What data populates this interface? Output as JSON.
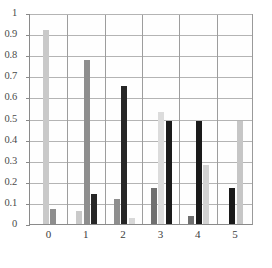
{
  "chart_data": {
    "type": "bar",
    "title": "",
    "subtitle": "",
    "xlabel": "",
    "ylabel": "",
    "categories": [
      "0",
      "1",
      "2",
      "3",
      "4",
      "5"
    ],
    "ylim": [
      0,
      1
    ],
    "yticks": [
      "0",
      "0.1",
      "0.2",
      "0.3",
      "0.4",
      "0.5",
      "0.6",
      "0.7",
      "0.8",
      "0.9",
      "1"
    ],
    "ytick_values": [
      0,
      0.1,
      0.2,
      0.3,
      0.4,
      0.5,
      0.6,
      0.7,
      0.8,
      0.9,
      1
    ],
    "grid": "horizontal-and-vertical",
    "legend": "none",
    "series": [
      {
        "name": "series-light",
        "color": "#c9c9c9",
        "values": [
          0.92,
          0.06,
          0.0,
          0.53,
          0.28,
          0.49
        ]
      },
      {
        "name": "series-medium",
        "color": "#8e8e8e",
        "values": [
          0.07,
          0.775,
          0.12,
          0.0,
          0.0,
          0.0
        ]
      },
      {
        "name": "series-dark",
        "color": "#262626",
        "values": [
          0.0,
          0.14,
          0.655,
          0.49,
          0.49,
          0.17
        ]
      }
    ],
    "group_bars": [
      {
        "category": "0",
        "bars": [
          {
            "series": "series-light",
            "value": 0.92,
            "color": "#c9c9c9"
          },
          {
            "series": "series-medium",
            "value": 0.07,
            "color": "#8e8e8e"
          }
        ]
      },
      {
        "category": "1",
        "bars": [
          {
            "series": "series-light",
            "value": 0.06,
            "color": "#c9c9c9"
          },
          {
            "series": "series-medium",
            "value": 0.775,
            "color": "#8e8e8e"
          },
          {
            "series": "series-dark",
            "value": 0.14,
            "color": "#262626"
          }
        ]
      },
      {
        "category": "2",
        "bars": [
          {
            "series": "series-medium",
            "value": 0.12,
            "color": "#8e8e8e"
          },
          {
            "series": "series-dark",
            "value": 0.655,
            "color": "#262626"
          },
          {
            "series": "series-light",
            "value": 0.03,
            "color": "#d8d8d8"
          }
        ]
      },
      {
        "category": "3",
        "bars": [
          {
            "series": "series-medium",
            "value": 0.17,
            "color": "#6f6f6f"
          },
          {
            "series": "series-light",
            "value": 0.53,
            "color": "#dcdcdc"
          },
          {
            "series": "series-dark",
            "value": 0.49,
            "color": "#1a1a1a"
          }
        ]
      },
      {
        "category": "4",
        "bars": [
          {
            "series": "series-medium",
            "value": 0.04,
            "color": "#6f6f6f"
          },
          {
            "series": "series-dark",
            "value": 0.49,
            "color": "#1a1a1a"
          },
          {
            "series": "series-light",
            "value": 0.28,
            "color": "#d2d2d2"
          }
        ]
      },
      {
        "category": "5",
        "bars": [
          {
            "series": "series-dark",
            "value": 0.17,
            "color": "#1a1a1a"
          },
          {
            "series": "series-light",
            "value": 0.49,
            "color": "#c6c6c6"
          }
        ]
      }
    ]
  },
  "axes": {
    "y_zero_label": "0",
    "y_top_label": "1"
  },
  "colors": {
    "light": "#c9c9c9",
    "medium": "#8e8e8e",
    "dark": "#1a1a1a",
    "grid": "#b4b4b4",
    "axis": "#8a8a8a",
    "background": "#ffffff"
  }
}
